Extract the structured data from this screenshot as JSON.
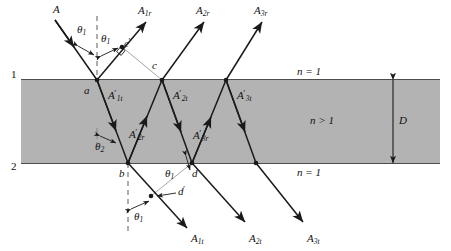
{
  "figure": {
    "colors": {
      "slab_fill": "#b3b3b3",
      "ray": "#1a1a1a",
      "thin_line": "#8c8c8c",
      "background": "#ffffff"
    },
    "interfaces": {
      "top_label": "1",
      "bottom_label": "2"
    },
    "media": {
      "above": "n = 1",
      "inside": "n > 1",
      "below": "n = 1"
    },
    "thickness_label": "D",
    "angles": [
      {
        "name": "theta1-incident",
        "text": "θ",
        "sub": "1"
      },
      {
        "name": "theta1-reflected",
        "text": "θ",
        "sub": "1"
      },
      {
        "name": "theta1-refracted-exit",
        "text": "θ",
        "sub": "1"
      },
      {
        "name": "theta1-bottom",
        "text": "θ",
        "sub": "1"
      },
      {
        "name": "theta2-internal",
        "text": "θ",
        "sub": "2"
      }
    ],
    "points": [
      {
        "name": "point-a",
        "label": "a"
      },
      {
        "name": "point-b",
        "label": "b"
      },
      {
        "name": "point-c",
        "label": "c"
      },
      {
        "name": "point-c-prime",
        "label": "c",
        "prime": "′"
      },
      {
        "name": "point-d",
        "label": "d"
      },
      {
        "name": "point-d-prime",
        "label": "d",
        "prime": "′"
      }
    ],
    "rays": {
      "incident": {
        "label": "A"
      },
      "reflected": [
        {
          "label": "A",
          "sub": "1r"
        },
        {
          "label": "A",
          "sub": "2r"
        },
        {
          "label": "A",
          "sub": "3r"
        }
      ],
      "transmitted": [
        {
          "label": "A",
          "sub": "1t"
        },
        {
          "label": "A",
          "sub": "2t"
        },
        {
          "label": "A",
          "sub": "3t"
        }
      ],
      "internal": [
        {
          "label": "A",
          "sub": "1t",
          "prime": "′"
        },
        {
          "label": "A",
          "sub": "2r",
          "prime": "′"
        },
        {
          "label": "A",
          "sub": "2t",
          "prime": "′"
        },
        {
          "label": "A",
          "sub": "3r",
          "prime": "′"
        },
        {
          "label": "A",
          "sub": "3t",
          "prime": "′"
        }
      ]
    }
  },
  "labels": {
    "interface_1": "1",
    "interface_2": "2",
    "n_top": "n = 1",
    "n_slab": "n > 1",
    "n_bottom": "n = 1",
    "D": "D",
    "A": "A",
    "A1r_sub": "1r",
    "A2r_sub": "2r",
    "A3r_sub": "3r",
    "A1t_sub": "1t",
    "A2t_sub": "2t",
    "A3t_sub": "3t",
    "A_letter": "A",
    "theta": "θ",
    "sub1": "1",
    "sub2": "2",
    "a": "a",
    "b": "b",
    "c": "c",
    "d": "d",
    "prime": "′"
  }
}
